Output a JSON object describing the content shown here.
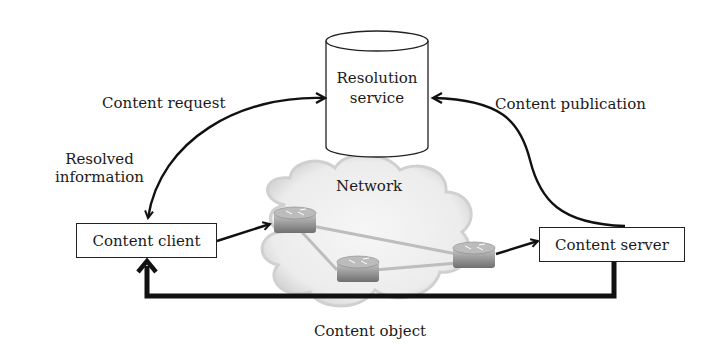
{
  "diagram": {
    "nodes": {
      "resolution_service": "Resolution\nservice",
      "resolution_service_line1": "Resolution",
      "resolution_service_line2": "service",
      "content_client": "Content client",
      "content_server": "Content server",
      "network": "Network"
    },
    "edges": {
      "content_request": "Content request",
      "resolved_information_line1": "Resolved",
      "resolved_information_line2": "information",
      "content_publication": "Content publication",
      "content_object": "Content object"
    },
    "routers": 3
  }
}
